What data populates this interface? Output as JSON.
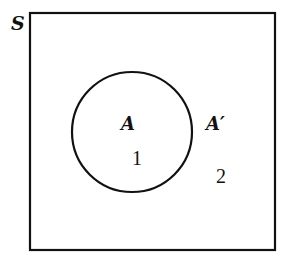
{
  "diagram": {
    "type": "venn",
    "universe_label": "S",
    "set": {
      "label": "A",
      "region_number": "1"
    },
    "complement": {
      "label": "A′",
      "region_number": "2"
    }
  }
}
